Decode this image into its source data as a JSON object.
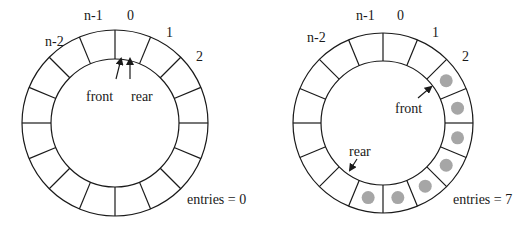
{
  "colors": {
    "stroke": "#1a1a1a",
    "entry_fill": "#a6a6a6",
    "background": "#ffffff"
  },
  "segments_per_ring": 16,
  "left_queue": {
    "title": "empty circular queue",
    "slot_labels": {
      "n_minus_2": "n-2",
      "n_minus_1": "n-1",
      "zero": "0",
      "one": "1",
      "two": "2"
    },
    "front_label": "front",
    "rear_label": "rear",
    "entries_label": "entries = 0",
    "filled_slots": []
  },
  "right_queue": {
    "title": "circular queue with 7 entries",
    "slot_labels": {
      "n_minus_2": "n-2",
      "n_minus_1": "n-1",
      "zero": "0",
      "one": "1",
      "two": "2"
    },
    "front_label": "front",
    "rear_label": "rear",
    "entries_label": "entries = 7",
    "filled_slots": [
      2,
      3,
      4,
      5,
      6,
      7,
      8
    ]
  }
}
